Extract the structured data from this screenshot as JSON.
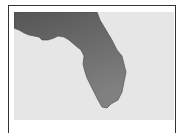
{
  "map": {
    "region": "Florida",
    "land_color": "#5e5e5e",
    "land_gradient_end": "#7d7d7d",
    "water_color": "#e6e6e6",
    "border_color": "#333333"
  },
  "caption": ""
}
